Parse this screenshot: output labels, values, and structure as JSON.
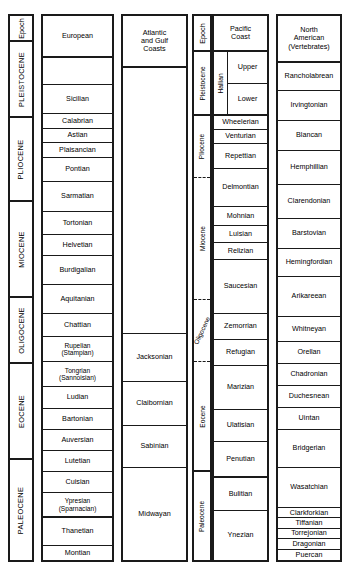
{
  "chart_data": {
    "type": "table",
    "columns": [
      {
        "id": "epoch-europe",
        "header": "Epoch",
        "orientation": "vertical",
        "entries": [
          {
            "label": "PLEISTOCENE"
          },
          {
            "label": "PLIOCENE"
          },
          {
            "label": "MIOCENE"
          },
          {
            "label": "OLIGOCENE"
          },
          {
            "label": "EOCENE"
          },
          {
            "label": "PALEOCENE"
          }
        ]
      },
      {
        "id": "european",
        "header": "European",
        "entries": [
          {
            "label": ""
          },
          {
            "label": "Sicilian"
          },
          {
            "label": "Calabrian"
          },
          {
            "label": "Astian"
          },
          {
            "label": "Plaisancian"
          },
          {
            "label": "Pontian"
          },
          {
            "label": "Sarmatian"
          },
          {
            "label": "Tortonian"
          },
          {
            "label": "Helvetian"
          },
          {
            "label": "Burdigalian"
          },
          {
            "label": "Aquitanian"
          },
          {
            "label": "Chattian"
          },
          {
            "label": "Rupelian (Stampian)"
          },
          {
            "label": "Tongrian (Sannoisian)"
          },
          {
            "label": "Ludian"
          },
          {
            "label": "Bartonian"
          },
          {
            "label": "Auversian"
          },
          {
            "label": "Lutetian"
          },
          {
            "label": "Cuisian"
          },
          {
            "label": "Ypresian (Sparnacian)"
          },
          {
            "label": "Thanetian"
          },
          {
            "label": "Montian"
          }
        ]
      },
      {
        "id": "atlantic-gulf",
        "header": "Atlantic and Gulf Coasts",
        "entries": [
          {
            "label": ""
          },
          {
            "label": "Jacksonian"
          },
          {
            "label": "Claibornian"
          },
          {
            "label": "Sabinian"
          },
          {
            "label": "Midwayan"
          }
        ]
      },
      {
        "id": "epoch-pacific",
        "header": "Epoch",
        "orientation": "vertical",
        "entries": [
          {
            "label": "Pleistocene"
          },
          {
            "label": "Pliocene"
          },
          {
            "label": "Miocene"
          },
          {
            "label": "Oligocene"
          },
          {
            "label": "Eocene"
          },
          {
            "label": "Paleocene"
          }
        ]
      },
      {
        "id": "pacific-coast",
        "header": "Pacific Coast",
        "entries": [
          {
            "label": "Hallian",
            "orientation": "vertical",
            "children": [
              {
                "label": "Upper"
              },
              {
                "label": "Lower"
              }
            ]
          },
          {
            "label": "Wheelerian"
          },
          {
            "label": "Venturian"
          },
          {
            "label": "Repettian"
          },
          {
            "label": "Delmontian"
          },
          {
            "label": "Mohnian"
          },
          {
            "label": "Luisian"
          },
          {
            "label": "Relizian"
          },
          {
            "label": "Saucesian"
          },
          {
            "label": "Zemorrian"
          },
          {
            "label": "Refugian"
          },
          {
            "label": "Marizian"
          },
          {
            "label": "Ulatisian"
          },
          {
            "label": "Penutian"
          },
          {
            "label": "Bulitian"
          },
          {
            "label": "Ynezian"
          }
        ]
      },
      {
        "id": "north-american-vertebrates",
        "header": "North American (Vertebrates)",
        "entries": [
          {
            "label": "Rancholabrean"
          },
          {
            "label": "Irvingtonian"
          },
          {
            "label": "Blancan"
          },
          {
            "label": "Hemphillian"
          },
          {
            "label": "Clarendonian"
          },
          {
            "label": "Barstovian"
          },
          {
            "label": "Hemingfordian"
          },
          {
            "label": "Arikareean"
          },
          {
            "label": "Whitneyan"
          },
          {
            "label": "Orellan"
          },
          {
            "label": "Chadronian"
          },
          {
            "label": "Duchesnean"
          },
          {
            "label": "Uintan"
          },
          {
            "label": "Bridgerian"
          },
          {
            "label": "Wasatchian"
          },
          {
            "label": "Clarkforkian"
          },
          {
            "label": "Tiffanian"
          },
          {
            "label": "Torrejonian"
          },
          {
            "label": "Dragonian"
          },
          {
            "label": "Puercan"
          }
        ]
      }
    ],
    "colors": {
      "border": "#1a1a1a",
      "background": "#ffffff",
      "text": "#000000"
    }
  },
  "headers": {
    "epoch_left": "Epoch",
    "european": "European",
    "atlantic_line1": "Atlantic",
    "atlantic_line2": "and Gulf",
    "atlantic_line3": "Coasts",
    "epoch_right": "Epoch",
    "pacific_line1": "Pacific",
    "pacific_line2": "Coast",
    "nam_line1": "North",
    "nam_line2": "American",
    "nam_line3": "(Vertebrates)"
  },
  "epoch_left": {
    "pleistocene": "PLEISTOCENE",
    "pliocene": "PLIOCENE",
    "miocene": "MIOCENE",
    "oligocene": "OLIGOCENE",
    "eocene": "EOCENE",
    "paleocene": "PALEOCENE"
  },
  "european": {
    "blank": "",
    "sicilian": "Sicilian",
    "calabrian": "Calabrian",
    "astian": "Astian",
    "plaisancian": "Plaisancian",
    "pontian": "Pontian",
    "sarmatian": "Sarmatian",
    "tortonian": "Tortonian",
    "helvetian": "Helvetian",
    "burdigalian": "Burdigalian",
    "aquitanian": "Aquitanian",
    "chattian": "Chattian",
    "rupelian_1": "Rupelian",
    "rupelian_2": "(Stampian)",
    "tongrian_1": "Tongrian",
    "tongrian_2": "(Sannoisian)",
    "ludian": "Ludian",
    "bartonian": "Bartonian",
    "auversian": "Auversian",
    "lutetian": "Lutetian",
    "cuisian": "Cuisian",
    "ypresian_1": "Ypresian",
    "ypresian_2": "(Sparnacian)",
    "thanetian": "Thanetian",
    "montian": "Montian"
  },
  "atlantic": {
    "blank": "",
    "jacksonian": "Jacksonian",
    "claibornian": "Claibornian",
    "sabinian": "Sabinian",
    "midwayan": "Midwayan"
  },
  "epoch_right": {
    "pleistocene": "Pleistocene",
    "pliocene": "Pliocene",
    "miocene": "Miocene",
    "oligocene": "Oligocene",
    "eocene": "Eocene",
    "paleocene": "Paleocene"
  },
  "pacific": {
    "hallian": "Hallian",
    "upper": "Upper",
    "lower": "Lower",
    "wheelerian": "Wheelerian",
    "venturian": "Venturian",
    "repettian": "Repettian",
    "delmontian": "Delmontian",
    "mohnian": "Mohnian",
    "luisian": "Luisian",
    "relizian": "Relizian",
    "saucesian": "Saucesian",
    "zemorrian": "Zemorrian",
    "refugian": "Refugian",
    "marizian": "Marizian",
    "ulatisian": "Ulatisian",
    "penutian": "Penutian",
    "bulitian": "Bulitian",
    "ynezian": "Ynezian"
  },
  "nam": {
    "rancholabrean": "Rancholabrean",
    "irvingtonian": "Irvingtonian",
    "blancan": "Blancan",
    "hemphillian": "Hemphillian",
    "clarendonian": "Clarendonian",
    "barstovian": "Barstovian",
    "hemingfordian": "Hemingfordian",
    "arikareean": "Arikareean",
    "whitneyan": "Whitneyan",
    "orellan": "Orellan",
    "chadronian": "Chadronian",
    "duchesnean": "Duchesnean",
    "uintan": "Uintan",
    "bridgerian": "Bridgerian",
    "wasatchian": "Wasatchian",
    "clarkforkian": "Clarkforkian",
    "tiffanian": "Tiffanian",
    "torrejonian": "Torrejonian",
    "dragonian": "Dragonian",
    "puercan": "Puercan"
  }
}
